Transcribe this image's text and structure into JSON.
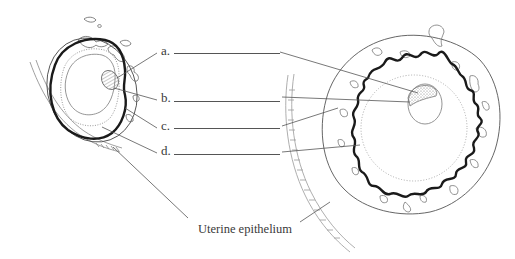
{
  "figure": {
    "type": "diagram",
    "labels": [
      {
        "letter": "a.",
        "answer_blank": ""
      },
      {
        "letter": "b.",
        "answer_blank": ""
      },
      {
        "letter": "c.",
        "answer_blank": ""
      },
      {
        "letter": "d.",
        "answer_blank": ""
      }
    ],
    "caption_label": "Uterine epithelium",
    "colors": {
      "line": "#555555",
      "thick_outline": "#1a1a1a",
      "dotted": "#9a9a9a",
      "text": "#3a3a3a"
    }
  }
}
